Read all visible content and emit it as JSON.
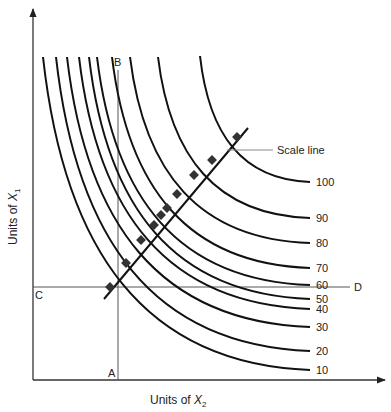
{
  "diagram": {
    "type": "isoquant-map",
    "x_axis_label": "Units of ",
    "x_axis_var": "X",
    "x_axis_sub": "2",
    "y_axis_label": "Units of ",
    "y_axis_var": "X",
    "y_axis_sub": "1",
    "point_labels": {
      "A": "A",
      "B": "B",
      "C": "C",
      "D": "D"
    },
    "scale_line_label": "Scale line",
    "isoquants": [
      {
        "label": "10",
        "start": [
          43,
          57
        ],
        "end": [
          310,
          370
        ]
      },
      {
        "label": "20",
        "start": [
          56,
          57
        ],
        "end": [
          310,
          351
        ]
      },
      {
        "label": "30",
        "start": [
          67,
          57
        ],
        "end": [
          310,
          327
        ]
      },
      {
        "label": "40",
        "start": [
          79,
          57
        ],
        "end": [
          310,
          309
        ]
      },
      {
        "label": "50",
        "start": [
          89,
          57
        ],
        "end": [
          310,
          299
        ]
      },
      {
        "label": "60",
        "start": [
          97,
          57
        ],
        "end": [
          310,
          285
        ]
      },
      {
        "label": "70",
        "start": [
          112,
          57
        ],
        "end": [
          310,
          268
        ]
      },
      {
        "label": "80",
        "start": [
          130,
          57
        ],
        "end": [
          310,
          243
        ]
      },
      {
        "label": "90",
        "start": [
          158,
          57
        ],
        "end": [
          310,
          218
        ]
      },
      {
        "label": "100",
        "start": [
          200,
          56
        ],
        "end": [
          310,
          182
        ]
      }
    ],
    "scale_points": [
      [
        110,
        287
      ],
      [
        126,
        263
      ],
      [
        141,
        240
      ],
      [
        154,
        225
      ],
      [
        161,
        215
      ],
      [
        167,
        208
      ],
      [
        177,
        194
      ],
      [
        194,
        175
      ],
      [
        212,
        160
      ],
      [
        237,
        137
      ]
    ]
  }
}
